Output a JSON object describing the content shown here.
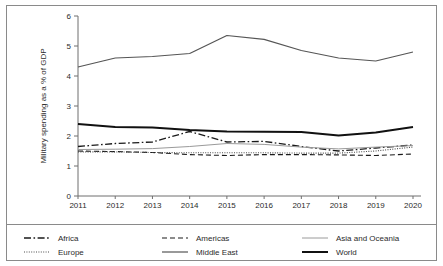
{
  "chart_data": {
    "type": "line",
    "title": "",
    "xlabel": "",
    "ylabel": "Military spending as a % of GDP",
    "categories": [
      "2011",
      "2012",
      "2013",
      "2014",
      "2015",
      "2016",
      "2017",
      "2018",
      "2019",
      "2020"
    ],
    "x": [
      2011,
      2012,
      2013,
      2014,
      2015,
      2016,
      2017,
      2018,
      2019,
      2020
    ],
    "ylim": [
      0,
      6
    ],
    "yticks": [
      0,
      1,
      2,
      3,
      4,
      5,
      6
    ],
    "ytick_labels": [
      "0",
      "1",
      "2",
      "3",
      "4",
      "5",
      "6"
    ],
    "grid": false,
    "legend_position": "bottom",
    "series": [
      {
        "name": "Africa",
        "style": "dash-dot",
        "color": "#1a1a1a",
        "width": 1.3,
        "dash": "7,2.5,1.6,2.5",
        "values": [
          1.65,
          1.75,
          1.8,
          2.15,
          1.8,
          1.82,
          1.65,
          1.5,
          1.6,
          1.7
        ]
      },
      {
        "name": "Americas",
        "style": "dashed",
        "color": "#1a1a1a",
        "width": 1.1,
        "dash": "5,3",
        "values": [
          1.5,
          1.48,
          1.45,
          1.38,
          1.35,
          1.38,
          1.38,
          1.37,
          1.35,
          1.4
        ]
      },
      {
        "name": "Asia and Oceania",
        "style": "solid-thin",
        "color": "#9a9a9a",
        "width": 1.0,
        "dash": "none",
        "values": [
          1.55,
          1.56,
          1.58,
          1.65,
          1.75,
          1.72,
          1.63,
          1.57,
          1.63,
          1.68
        ]
      },
      {
        "name": "Europe",
        "style": "dotted",
        "color": "#4d4d4d",
        "width": 1.1,
        "dash": "1,1.4",
        "values": [
          1.47,
          1.47,
          1.45,
          1.44,
          1.44,
          1.44,
          1.43,
          1.43,
          1.5,
          1.63
        ]
      },
      {
        "name": "Middle East",
        "style": "solid-medium",
        "color": "#555555",
        "width": 1.2,
        "dash": "none",
        "values": [
          4.3,
          4.6,
          4.65,
          4.75,
          5.35,
          5.22,
          4.85,
          4.6,
          4.5,
          4.8
        ]
      },
      {
        "name": "World",
        "style": "solid-thick",
        "color": "#111111",
        "width": 2.0,
        "dash": "none",
        "values": [
          2.4,
          2.3,
          2.28,
          2.2,
          2.15,
          2.14,
          2.13,
          2.02,
          2.12,
          2.3
        ]
      }
    ]
  },
  "legend": {
    "entries": [
      {
        "label": "Africa",
        "column": 0,
        "row": 0
      },
      {
        "label": "Europe",
        "column": 0,
        "row": 1
      },
      {
        "label": "Americas",
        "column": 1,
        "row": 0
      },
      {
        "label": "Middle East",
        "column": 1,
        "row": 1
      },
      {
        "label": "Asia and Oceania",
        "column": 2,
        "row": 0
      },
      {
        "label": "World",
        "column": 2,
        "row": 1
      }
    ]
  },
  "colors": {
    "frame": "#8a8a8a",
    "axis": "#6f6f6f",
    "text": "#2b2b2b",
    "background": "#ffffff"
  }
}
